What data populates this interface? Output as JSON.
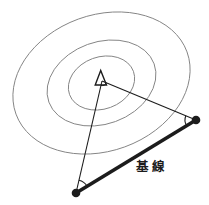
{
  "diagram": {
    "baseline_label": "基線",
    "colors": {
      "background": "#ffffff",
      "contour_stroke": "#858585",
      "ink": "#1c1c1c"
    },
    "markers": {
      "target_marker": "triangle-outline-icon",
      "observer_marker": "filled-dot-icon",
      "angle_marks": "arc-tick"
    }
  }
}
